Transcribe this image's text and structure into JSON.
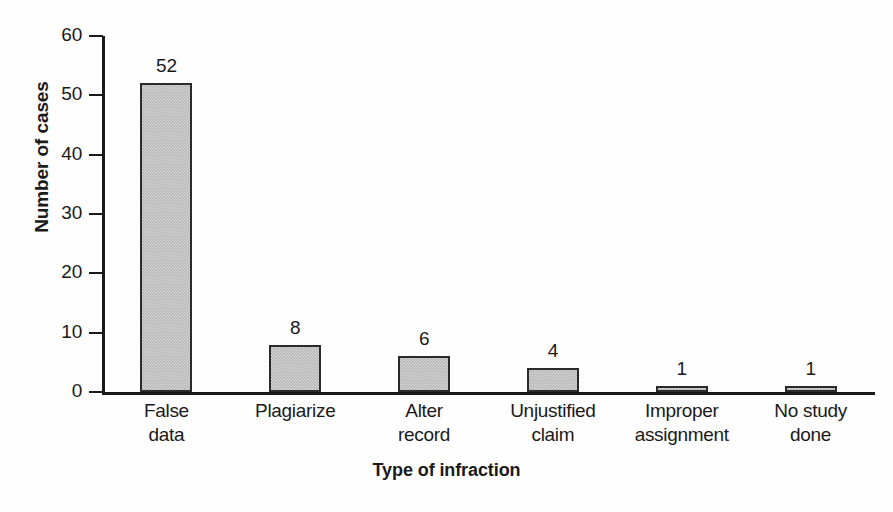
{
  "chart_data": {
    "type": "bar",
    "title": "",
    "subtitle": "",
    "xlabel": "Type of infraction",
    "ylabel": "Number of cases",
    "categories": [
      "False data",
      "Plagiarize",
      "Alter record",
      "Unjustified claim",
      "Improper assignment",
      "No study done"
    ],
    "category_lines": [
      [
        "False",
        "data"
      ],
      [
        "Plagiarize",
        ""
      ],
      [
        "Alter",
        "record"
      ],
      [
        "Unjustified",
        "claim"
      ],
      [
        "Improper",
        "assignment"
      ],
      [
        "No study",
        "done"
      ]
    ],
    "values": [
      52,
      8,
      6,
      4,
      1,
      1
    ],
    "data_labels": [
      "52",
      "8",
      "6",
      "4",
      "1",
      "1"
    ],
    "ylim": [
      0,
      60
    ],
    "ytick_values": [
      0,
      10,
      20,
      30,
      40,
      50,
      60
    ],
    "ytick_labels": [
      "0",
      "10",
      "20",
      "30",
      "40",
      "50",
      "60"
    ],
    "grid": false,
    "legend": null,
    "legend_position": "none",
    "bar_fill_color": "#b6b6b6",
    "bar_edge_color": "#2a2a2a",
    "axis_color": "#1a1a1a",
    "background_color": "#fefefe",
    "annotations": []
  }
}
